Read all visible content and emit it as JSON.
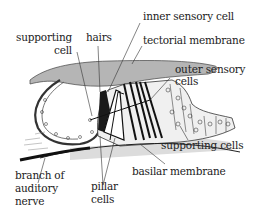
{
  "diagram": {
    "colors": {
      "tectorial_membrane": "#b8b8b8",
      "basilar_fill": "#d8d8d8",
      "ink": "#222222",
      "background": "#ffffff"
    },
    "labels": {
      "supporting_cell_line1": "supporting",
      "supporting_cell_line2": "cell",
      "hairs": "hairs",
      "inner_sensory_cell": "inner sensory cell",
      "tectorial_membrane": "tectorial membrane",
      "outer_sensory_line1": "outer sensory",
      "outer_sensory_line2": "cells",
      "supporting_cells": "supporting cells",
      "basilar_membrane": "basilar membrane",
      "branch_line1": "branch of",
      "branch_line2": "auditory",
      "branch_line3": "nerve",
      "pillar_line1": "pillar",
      "pillar_line2": "cells"
    }
  }
}
